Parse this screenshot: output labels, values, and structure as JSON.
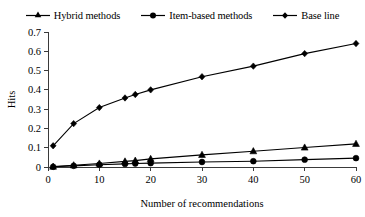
{
  "chart_data": {
    "type": "line",
    "title": "",
    "xlabel": "Number of recommendations",
    "ylabel": "Hits",
    "xlim": [
      0,
      60
    ],
    "ylim": [
      0,
      0.7
    ],
    "x_ticks": [
      0,
      10,
      20,
      30,
      40,
      50,
      60
    ],
    "y_ticks": [
      "0",
      "0.1",
      "0.2",
      "0.3",
      "0.4",
      "0.5",
      "0.6",
      "0.7"
    ],
    "y_tick_values": [
      0,
      0.1,
      0.2,
      0.3,
      0.4,
      0.5,
      0.6,
      0.7
    ],
    "grid": false,
    "legend_position": "top",
    "x": [
      1,
      5,
      10,
      15,
      17,
      20,
      30,
      40,
      50,
      60
    ],
    "series": [
      {
        "name": "Hybrid methods",
        "marker": "triangle",
        "values": [
          0.002,
          0.009,
          0.018,
          0.029,
          0.033,
          0.042,
          0.063,
          0.082,
          0.101,
          0.12
        ]
      },
      {
        "name": "Item-based methods",
        "marker": "circle",
        "values": [
          0.001,
          0.006,
          0.012,
          0.016,
          0.018,
          0.02,
          0.026,
          0.03,
          0.038,
          0.046
        ]
      },
      {
        "name": "Base line",
        "marker": "diamond",
        "values": [
          0.11,
          0.225,
          0.308,
          0.358,
          0.376,
          0.4,
          0.468,
          0.523,
          0.588,
          0.64
        ]
      }
    ]
  },
  "legend": {
    "items": [
      {
        "label": "Hybrid methods",
        "marker": "triangle-marker"
      },
      {
        "label": "Item-based methods",
        "marker": "circle-marker"
      },
      {
        "label": "Base line",
        "marker": "diamond-marker"
      }
    ]
  },
  "axes": {
    "y_title": "Hits",
    "x_title": "Number of recommendations"
  },
  "colors": {
    "series": "#000000",
    "axis": "#3a3a3a",
    "background": "#ffffff"
  }
}
